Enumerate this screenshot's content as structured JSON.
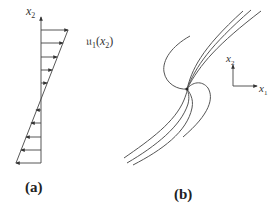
{
  "panel_a": {
    "label": "(a)",
    "axis_label": "x",
    "axis_sub": "2",
    "profile_label_main": "𝔲",
    "profile_label_sub": "1",
    "profile_label_arg_open": "(",
    "profile_label_arg": "x",
    "profile_label_arg_sub": "2",
    "profile_label_arg_close": ")",
    "axis_x": 41,
    "axis_top": 17,
    "axis_bottom": 163,
    "arrows": [
      {
        "y": 30,
        "x_end": 68
      },
      {
        "y": 43,
        "x_end": 63
      },
      {
        "y": 57,
        "x_end": 57
      },
      {
        "y": 70,
        "x_end": 52
      },
      {
        "y": 83,
        "x_end": 47
      },
      {
        "y": 110,
        "x_end": 36
      },
      {
        "y": 123,
        "x_end": 31
      },
      {
        "y": 137,
        "x_end": 26
      },
      {
        "y": 150,
        "x_end": 21
      },
      {
        "y": 163,
        "x_end": 16
      }
    ],
    "profile_line": {
      "x1": 68,
      "y1": 30,
      "x2": 16,
      "y2": 163
    }
  },
  "panel_b": {
    "label": "(b)",
    "center": {
      "x": 187,
      "y": 89
    },
    "axis_x1_label": "x",
    "axis_x1_sub": "1",
    "axis_x2_label": "x",
    "axis_x2_sub": "2"
  },
  "colors": {
    "stroke": "#444444",
    "text": "#333333",
    "background": "#ffffff"
  }
}
